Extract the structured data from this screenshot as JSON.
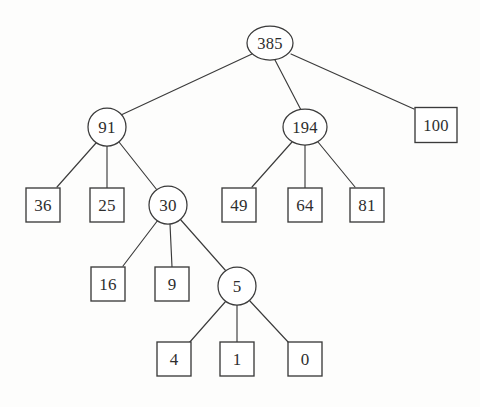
{
  "diagram": {
    "type": "tree",
    "canvas": {
      "width": 480,
      "height": 407
    },
    "colors": {
      "background": "#fdfdfc",
      "stroke": "#3b3b3b",
      "node_fill": "#ffffff",
      "text": "#2e2e2e"
    },
    "nodes": [
      {
        "id": "n385",
        "label": "385",
        "shape": "ellipse",
        "cx": 270,
        "cy": 43,
        "rx": 23,
        "ry": 17
      },
      {
        "id": "n91",
        "label": "91",
        "shape": "ellipse",
        "cx": 107,
        "cy": 127,
        "rx": 19,
        "ry": 19
      },
      {
        "id": "n194",
        "label": "194",
        "shape": "ellipse",
        "cx": 305,
        "cy": 127,
        "rx": 22,
        "ry": 18
      },
      {
        "id": "n100",
        "label": "100",
        "shape": "rect",
        "cx": 436,
        "cy": 125,
        "w": 42,
        "h": 35
      },
      {
        "id": "n36",
        "label": "36",
        "shape": "rect",
        "cx": 43,
        "cy": 205,
        "w": 34,
        "h": 34
      },
      {
        "id": "n25",
        "label": "25",
        "shape": "rect",
        "cx": 107,
        "cy": 205,
        "w": 34,
        "h": 34
      },
      {
        "id": "n30",
        "label": "30",
        "shape": "ellipse",
        "cx": 168,
        "cy": 205,
        "rx": 19,
        "ry": 19
      },
      {
        "id": "n49",
        "label": "49",
        "shape": "rect",
        "cx": 239,
        "cy": 205,
        "w": 34,
        "h": 34
      },
      {
        "id": "n64",
        "label": "64",
        "shape": "rect",
        "cx": 305,
        "cy": 205,
        "w": 34,
        "h": 34
      },
      {
        "id": "n81",
        "label": "81",
        "shape": "rect",
        "cx": 367,
        "cy": 205,
        "w": 34,
        "h": 34
      },
      {
        "id": "n16",
        "label": "16",
        "shape": "rect",
        "cx": 108,
        "cy": 284,
        "w": 34,
        "h": 34
      },
      {
        "id": "n9",
        "label": "9",
        "shape": "rect",
        "cx": 172,
        "cy": 284,
        "w": 34,
        "h": 34
      },
      {
        "id": "n5",
        "label": "5",
        "shape": "ellipse",
        "cx": 237,
        "cy": 286,
        "rx": 19,
        "ry": 19
      },
      {
        "id": "n4",
        "label": "4",
        "shape": "rect",
        "cx": 174,
        "cy": 359,
        "w": 34,
        "h": 34
      },
      {
        "id": "n1",
        "label": "1",
        "shape": "rect",
        "cx": 237,
        "cy": 359,
        "w": 34,
        "h": 34
      },
      {
        "id": "n0",
        "label": "0",
        "shape": "rect",
        "cx": 305,
        "cy": 359,
        "w": 34,
        "h": 34
      }
    ],
    "edges": [
      {
        "from": "n385",
        "to": "n91",
        "x1": 252,
        "y1": 54,
        "x2": 121,
        "y2": 115
      },
      {
        "from": "n385",
        "to": "n194",
        "x1": 275,
        "y1": 60,
        "x2": 301,
        "y2": 110
      },
      {
        "from": "n385",
        "to": "n100",
        "x1": 291,
        "y1": 54,
        "x2": 414,
        "y2": 109
      },
      {
        "from": "n91",
        "to": "n36",
        "x1": 96,
        "y1": 143,
        "x2": 57,
        "y2": 187
      },
      {
        "from": "n91",
        "to": "n25",
        "x1": 107,
        "y1": 146,
        "x2": 107,
        "y2": 188
      },
      {
        "from": "n91",
        "to": "n30",
        "x1": 119,
        "y1": 142,
        "x2": 157,
        "y2": 190
      },
      {
        "from": "n194",
        "to": "n49",
        "x1": 292,
        "y1": 142,
        "x2": 252,
        "y2": 187
      },
      {
        "from": "n194",
        "to": "n64",
        "x1": 305,
        "y1": 145,
        "x2": 305,
        "y2": 188
      },
      {
        "from": "n194",
        "to": "n81",
        "x1": 318,
        "y1": 142,
        "x2": 355,
        "y2": 187
      },
      {
        "from": "n30",
        "to": "n16",
        "x1": 158,
        "y1": 220,
        "x2": 123,
        "y2": 266
      },
      {
        "from": "n30",
        "to": "n9",
        "x1": 170,
        "y1": 224,
        "x2": 172,
        "y2": 267
      },
      {
        "from": "n30",
        "to": "n5",
        "x1": 180,
        "y1": 219,
        "x2": 226,
        "y2": 271
      },
      {
        "from": "n5",
        "to": "n4",
        "x1": 226,
        "y1": 301,
        "x2": 189,
        "y2": 343
      },
      {
        "from": "n5",
        "to": "n1",
        "x1": 237,
        "y1": 305,
        "x2": 237,
        "y2": 342
      },
      {
        "from": "n5",
        "to": "n0",
        "x1": 249,
        "y1": 300,
        "x2": 289,
        "y2": 343
      }
    ]
  }
}
